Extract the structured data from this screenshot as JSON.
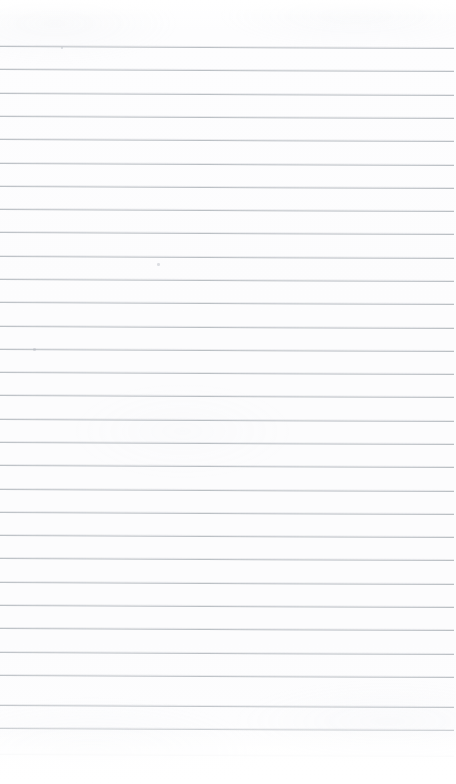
{
  "document": {
    "type": "scanned-ruled-notebook-paper",
    "content_text": "",
    "width_px": 456,
    "height_px": 784
  },
  "paper": {
    "background_color": "#fdfdfd",
    "edge_color": "#ffffff"
  },
  "ruling": {
    "line_color": "#b8bdc2",
    "line_thickness_px": 1,
    "line_spacing_px": 23.3,
    "first_line_y_px": 46,
    "skew_degrees": 0.26,
    "left_inset_px": 0,
    "right_inset_px": 2,
    "line_count": 31,
    "lines": [
      {
        "y": 46,
        "opacity": 0.95
      },
      {
        "y": 69,
        "opacity": 0.95
      },
      {
        "y": 93,
        "opacity": 0.95
      },
      {
        "y": 116,
        "opacity": 0.95
      },
      {
        "y": 139,
        "opacity": 0.95
      },
      {
        "y": 163,
        "opacity": 0.95
      },
      {
        "y": 186,
        "opacity": 0.95
      },
      {
        "y": 209,
        "opacity": 0.95
      },
      {
        "y": 232,
        "opacity": 0.95
      },
      {
        "y": 256,
        "opacity": 0.95
      },
      {
        "y": 279,
        "opacity": 0.95
      },
      {
        "y": 302,
        "opacity": 0.95
      },
      {
        "y": 326,
        "opacity": 0.95
      },
      {
        "y": 349,
        "opacity": 0.95
      },
      {
        "y": 372,
        "opacity": 0.95
      },
      {
        "y": 395,
        "opacity": 0.95
      },
      {
        "y": 419,
        "opacity": 0.95
      },
      {
        "y": 442,
        "opacity": 0.95
      },
      {
        "y": 465,
        "opacity": 0.95
      },
      {
        "y": 489,
        "opacity": 0.95
      },
      {
        "y": 512,
        "opacity": 0.95
      },
      {
        "y": 535,
        "opacity": 0.95
      },
      {
        "y": 558,
        "opacity": 0.95
      },
      {
        "y": 582,
        "opacity": 0.95
      },
      {
        "y": 605,
        "opacity": 0.95
      },
      {
        "y": 628,
        "opacity": 0.95
      },
      {
        "y": 652,
        "opacity": 0.92
      },
      {
        "y": 675,
        "opacity": 0.9
      },
      {
        "y": 705,
        "opacity": 0.85
      },
      {
        "y": 728,
        "opacity": 0.72
      },
      {
        "y": 754,
        "opacity": 0.22
      }
    ]
  },
  "artifacts": {
    "specks": [
      {
        "x": 157,
        "y": 263,
        "size": 2.5
      },
      {
        "x": 33,
        "y": 348,
        "size": 2.5
      },
      {
        "x": 61,
        "y": 47,
        "size": 1.6
      }
    ]
  },
  "margins": {
    "top_blank_px": 46,
    "bottom_blank_px": 30,
    "has_left_margin_rule": false,
    "has_hole_punches": false
  }
}
